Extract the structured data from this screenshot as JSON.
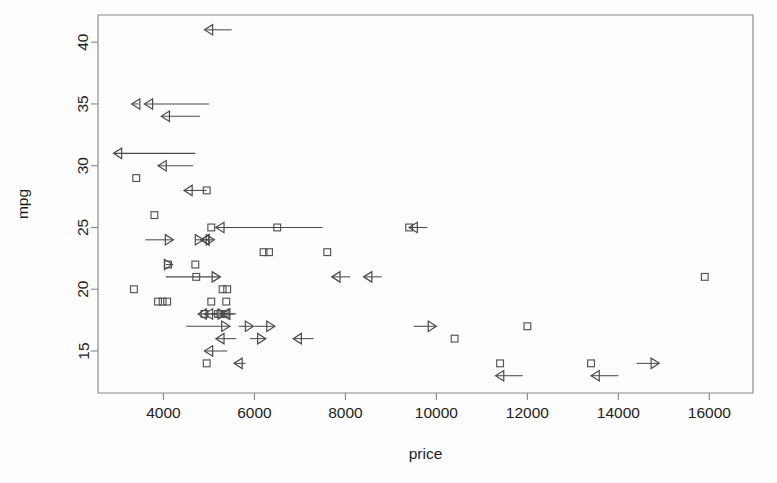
{
  "figure": {
    "background_color": "#fdfdfd",
    "frame_color": "#8a8a8a",
    "marker_color": "#525252",
    "arrow_color": "#4a4a4a"
  },
  "axes": {
    "x_title": "price",
    "y_title": "mpg",
    "x_ticks": [
      {
        "value": 4000,
        "label": "4000"
      },
      {
        "value": 6000,
        "label": "6000"
      },
      {
        "value": 8000,
        "label": "8000"
      },
      {
        "value": 10000,
        "label": "10000"
      },
      {
        "value": 12000,
        "label": "12000"
      },
      {
        "value": 14000,
        "label": "14000"
      },
      {
        "value": 16000,
        "label": "16000"
      }
    ],
    "y_ticks": [
      {
        "value": 15,
        "label": "15"
      },
      {
        "value": 20,
        "label": "20"
      },
      {
        "value": 25,
        "label": "25"
      },
      {
        "value": 30,
        "label": "30"
      },
      {
        "value": 35,
        "label": "35"
      },
      {
        "value": 40,
        "label": "40"
      }
    ]
  },
  "chart_data": {
    "type": "scatter",
    "title": "",
    "subtitle": "",
    "xlabel": "price",
    "ylabel": "mpg",
    "xlim": [
      2560,
      16960
    ],
    "ylim": [
      11.6,
      42.2
    ],
    "grid": false,
    "legend": null,
    "xtick_labels": [
      "4000",
      "6000",
      "8000",
      "10000",
      "12000",
      "14000",
      "16000"
    ],
    "xtick_values": [
      4000,
      6000,
      8000,
      10000,
      12000,
      14000,
      16000
    ],
    "ytick_labels": [
      "15",
      "20",
      "25",
      "30",
      "35",
      "40"
    ],
    "ytick_values": [
      15,
      20,
      25,
      30,
      35,
      40
    ],
    "marker_types": {
      "square": "uncensored observation, open square",
      "arrow_left": "censored observation, arrow pointing left with horizontal tail extending to the right",
      "arrow_right": "censored observation, arrow pointing right with horizontal tail extending to the left"
    },
    "series": [
      {
        "name": "uncensored",
        "marker": "square",
        "points": [
          {
            "price": 3400,
            "mpg": 29
          },
          {
            "price": 3800,
            "mpg": 26
          },
          {
            "price": 4950,
            "mpg": 28
          },
          {
            "price": 5050,
            "mpg": 25
          },
          {
            "price": 6500,
            "mpg": 25
          },
          {
            "price": 9400,
            "mpg": 25
          },
          {
            "price": 6200,
            "mpg": 23
          },
          {
            "price": 6320,
            "mpg": 23
          },
          {
            "price": 7600,
            "mpg": 23
          },
          {
            "price": 4100,
            "mpg": 22
          },
          {
            "price": 4700,
            "mpg": 22
          },
          {
            "price": 4720,
            "mpg": 21
          },
          {
            "price": 15900,
            "mpg": 21
          },
          {
            "price": 3350,
            "mpg": 20
          },
          {
            "price": 5300,
            "mpg": 20
          },
          {
            "price": 5400,
            "mpg": 20
          },
          {
            "price": 3880,
            "mpg": 19
          },
          {
            "price": 3980,
            "mpg": 19
          },
          {
            "price": 4080,
            "mpg": 19
          },
          {
            "price": 5050,
            "mpg": 19
          },
          {
            "price": 5380,
            "mpg": 19
          },
          {
            "price": 4900,
            "mpg": 18
          },
          {
            "price": 5200,
            "mpg": 18
          },
          {
            "price": 5250,
            "mpg": 18
          },
          {
            "price": 5320,
            "mpg": 18
          },
          {
            "price": 12000,
            "mpg": 17
          },
          {
            "price": 10400,
            "mpg": 16
          },
          {
            "price": 4950,
            "mpg": 14
          },
          {
            "price": 11400,
            "mpg": 14
          },
          {
            "price": 13400,
            "mpg": 14
          }
        ]
      },
      {
        "name": "censored-left",
        "marker": "arrow_left",
        "points": [
          {
            "price": 4900,
            "mpg": 41,
            "tail_to": 5500
          },
          {
            "price": 3300,
            "mpg": 35,
            "tail_to": 3450
          },
          {
            "price": 3580,
            "mpg": 35,
            "tail_to": 5000
          },
          {
            "price": 3950,
            "mpg": 34,
            "tail_to": 4800
          },
          {
            "price": 2900,
            "mpg": 31,
            "tail_to": 4700
          },
          {
            "price": 3880,
            "mpg": 30,
            "tail_to": 4650
          },
          {
            "price": 4450,
            "mpg": 28,
            "tail_to": 4950
          },
          {
            "price": 5150,
            "mpg": 25,
            "tail_to": 7500
          },
          {
            "price": 9400,
            "mpg": 25,
            "tail_to": 9800
          },
          {
            "price": 4820,
            "mpg": 24,
            "tail_to": 5000
          },
          {
            "price": 4820,
            "mpg": 24,
            "tail_to": 5000
          },
          {
            "price": 7700,
            "mpg": 21,
            "tail_to": 8100
          },
          {
            "price": 8400,
            "mpg": 21,
            "tail_to": 8800
          },
          {
            "price": 4760,
            "mpg": 18,
            "tail_to": 5150
          },
          {
            "price": 4900,
            "mpg": 18,
            "tail_to": 5200
          },
          {
            "price": 5260,
            "mpg": 18,
            "tail_to": 5550
          },
          {
            "price": 5280,
            "mpg": 18,
            "tail_to": 5600
          },
          {
            "price": 5150,
            "mpg": 16,
            "tail_to": 5600
          },
          {
            "price": 6850,
            "mpg": 16,
            "tail_to": 7300
          },
          {
            "price": 4900,
            "mpg": 15,
            "tail_to": 5400
          },
          {
            "price": 5550,
            "mpg": 14,
            "tail_to": 5800
          },
          {
            "price": 11300,
            "mpg": 13,
            "tail_to": 11900
          },
          {
            "price": 13400,
            "mpg": 13,
            "tail_to": 14000
          }
        ]
      },
      {
        "name": "censored-right",
        "marker": "arrow_right",
        "points": [
          {
            "price": 4220,
            "mpg": 24,
            "tail_from": 3600
          },
          {
            "price": 4880,
            "mpg": 24,
            "tail_from": 4700
          },
          {
            "price": 5120,
            "mpg": 24,
            "tail_from": 4950
          },
          {
            "price": 4200,
            "mpg": 22,
            "tail_from": 4050
          },
          {
            "price": 5250,
            "mpg": 21,
            "tail_from": 4050
          },
          {
            "price": 5380,
            "mpg": 18,
            "tail_from": 5050
          },
          {
            "price": 5460,
            "mpg": 17,
            "tail_from": 4500
          },
          {
            "price": 6450,
            "mpg": 17,
            "tail_from": 6000
          },
          {
            "price": 5980,
            "mpg": 17,
            "tail_from": 5650
          },
          {
            "price": 6250,
            "mpg": 16,
            "tail_from": 5900
          },
          {
            "price": 10000,
            "mpg": 17,
            "tail_from": 9500
          },
          {
            "price": 14900,
            "mpg": 14,
            "tail_from": 14400
          }
        ]
      }
    ]
  }
}
